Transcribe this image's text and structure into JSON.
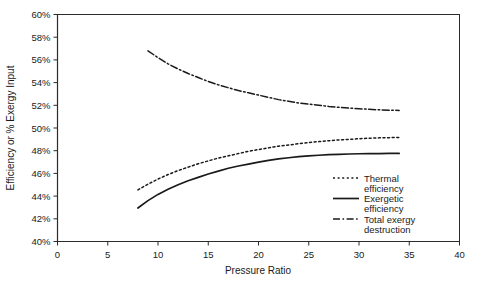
{
  "chart_data": {
    "type": "line",
    "title": "",
    "xlabel": "Pressure Ratio",
    "ylabel": "Efficiency or % Exergy Input",
    "xlim": [
      0,
      40
    ],
    "ylim": [
      40,
      60
    ],
    "xticks": [
      0,
      5,
      10,
      15,
      20,
      25,
      30,
      35,
      40
    ],
    "xtick_labels": [
      "0",
      "5",
      "10",
      "15",
      "20",
      "25",
      "30",
      "35",
      "40"
    ],
    "yticks": [
      40,
      42,
      44,
      46,
      48,
      50,
      52,
      54,
      56,
      58,
      60
    ],
    "ytick_labels": [
      "40%",
      "42%",
      "44%",
      "46%",
      "48%",
      "50%",
      "52%",
      "54%",
      "56%",
      "58%",
      "60%"
    ],
    "grid": false,
    "legend_position": "lower-right-inside",
    "series": [
      {
        "name": "Thermal efficiency",
        "style": "dotted",
        "color": "#1a1a1a",
        "x": [
          8,
          9,
          10,
          11,
          12,
          13,
          14,
          15,
          16,
          17,
          18,
          19,
          20,
          21,
          22,
          23,
          24,
          25,
          26,
          27,
          28,
          29,
          30,
          31,
          32,
          33,
          34
        ],
        "y": [
          44.55,
          45.05,
          45.5,
          45.9,
          46.25,
          46.55,
          46.85,
          47.1,
          47.35,
          47.55,
          47.75,
          47.95,
          48.1,
          48.25,
          48.4,
          48.5,
          48.62,
          48.72,
          48.8,
          48.88,
          48.95,
          49.0,
          49.05,
          49.1,
          49.13,
          49.15,
          49.17
        ]
      },
      {
        "name": "Exergetic efficiency",
        "style": "solid",
        "color": "#1a1a1a",
        "x": [
          8,
          9,
          10,
          11,
          12,
          13,
          14,
          15,
          16,
          17,
          18,
          19,
          20,
          21,
          22,
          23,
          24,
          25,
          26,
          27,
          28,
          29,
          30,
          31,
          32,
          33,
          34
        ],
        "y": [
          42.95,
          43.6,
          44.15,
          44.6,
          45.0,
          45.35,
          45.65,
          45.95,
          46.2,
          46.45,
          46.65,
          46.82,
          47.0,
          47.15,
          47.28,
          47.38,
          47.47,
          47.55,
          47.6,
          47.65,
          47.68,
          47.71,
          47.73,
          47.74,
          47.75,
          47.76,
          47.76
        ]
      },
      {
        "name": "Total exergy destruction",
        "style": "dash-dot",
        "color": "#1a1a1a",
        "x": [
          9,
          10,
          11,
          12,
          13,
          14,
          15,
          16,
          17,
          18,
          19,
          20,
          21,
          22,
          23,
          24,
          25,
          26,
          27,
          28,
          29,
          30,
          31,
          32,
          33,
          34
        ],
        "y": [
          56.8,
          56.2,
          55.65,
          55.2,
          54.8,
          54.45,
          54.1,
          53.8,
          53.55,
          53.3,
          53.1,
          52.9,
          52.7,
          52.5,
          52.35,
          52.2,
          52.1,
          52.0,
          51.9,
          51.82,
          51.75,
          51.7,
          51.65,
          51.6,
          51.57,
          51.55
        ]
      }
    ],
    "legend": [
      {
        "label_line1": "Thermal",
        "label_line2": "efficiency",
        "style": "dotted"
      },
      {
        "label_line1": "Exergetic",
        "label_line2": "efficiency",
        "style": "solid"
      },
      {
        "label_line1": "Total exergy",
        "label_line2": "destruction",
        "style": "dash-dot"
      }
    ]
  }
}
